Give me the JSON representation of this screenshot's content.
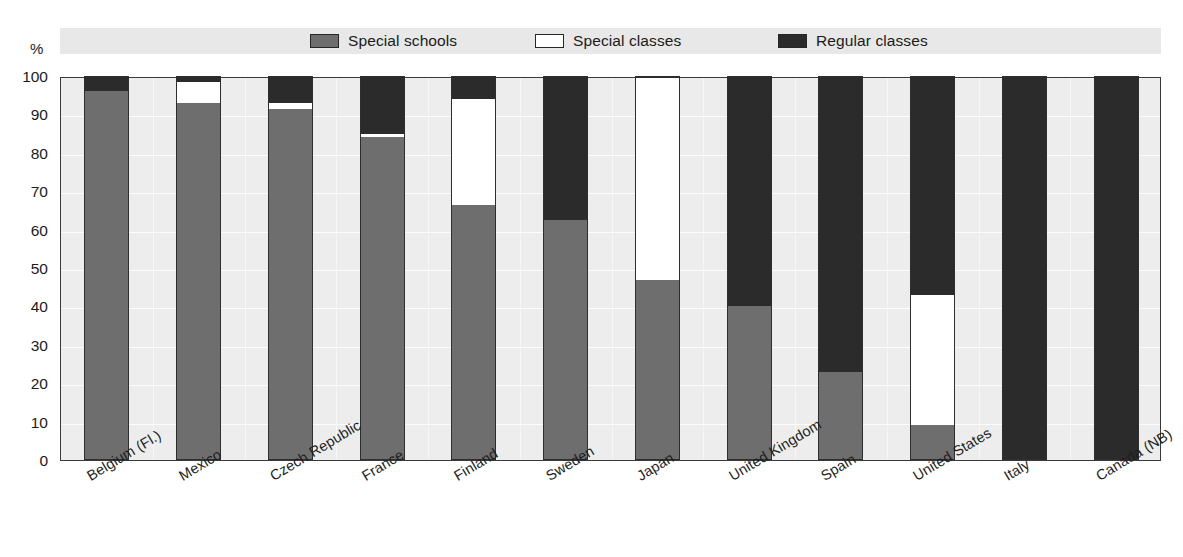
{
  "axis_unit": "%",
  "legend": {
    "items": [
      {
        "label": "Special schools",
        "color": "#6e6e6e",
        "x": 310
      },
      {
        "label": "Special classes",
        "color": "#ffffff",
        "x": 535
      },
      {
        "label": "Regular classes",
        "color": "#2b2b2b",
        "x": 778
      }
    ]
  },
  "chart_data": {
    "type": "bar",
    "title": "",
    "subtitle": "",
    "xlabel": "",
    "ylabel": "%",
    "ylim": [
      0,
      100
    ],
    "yticks": [
      0,
      10,
      20,
      30,
      40,
      50,
      60,
      70,
      80,
      90,
      100
    ],
    "ytick_labels": [
      "0",
      "10",
      "20",
      "30",
      "40",
      "50",
      "60",
      "70",
      "80",
      "90",
      "100"
    ],
    "grid": true,
    "stacked": true,
    "legend_position": "top",
    "categories": [
      "Belgium (Fl.)",
      "Mexico",
      "Czech Republic",
      "France",
      "Finland",
      "Sweden",
      "Japan",
      "United Kingdom",
      "Spain",
      "United States",
      "Italy",
      "Canada (NB)"
    ],
    "series": [
      {
        "name": "Special schools",
        "color": "#6e6e6e",
        "values": [
          96,
          93,
          91.5,
          84,
          66.5,
          62.5,
          47,
          40,
          23,
          9,
          0,
          0
        ]
      },
      {
        "name": "Special classes",
        "color": "#ffffff",
        "values": [
          0,
          5.5,
          1.5,
          1,
          27.5,
          0,
          52.5,
          0,
          0,
          34,
          0,
          0
        ]
      },
      {
        "name": "Regular classes",
        "color": "#2b2b2b",
        "values": [
          4,
          1.5,
          7,
          15,
          6,
          37.5,
          0.5,
          60,
          77,
          57,
          100,
          100
        ]
      }
    ]
  }
}
